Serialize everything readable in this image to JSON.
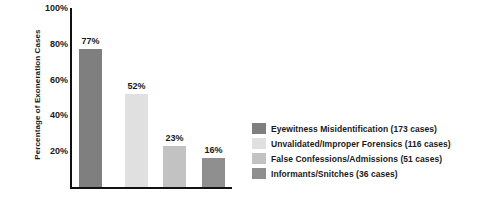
{
  "chart_data": {
    "type": "bar",
    "title": "",
    "xlabel": "",
    "ylabel": "Percentage of Exoneration Cases",
    "ylim": [
      0,
      100
    ],
    "grid": false,
    "legend_position": "right",
    "ytick_labels": [
      "100%",
      "80%",
      "60%",
      "40%",
      "20%"
    ],
    "ytick_values": [
      100,
      80,
      60,
      40,
      20
    ],
    "categories": [
      "Eyewitness Misidentification",
      "Unvalidated/Improper Forensics",
      "False Confessions/Admissions",
      "Informants/Snitches"
    ],
    "values": [
      77,
      52,
      23,
      16
    ],
    "data_labels": [
      "77%",
      "52%",
      "23%",
      "16%"
    ],
    "counts": [
      173,
      116,
      51,
      36
    ],
    "bar_colors": [
      "#7f7f7f",
      "#e0e0e0",
      "#c2c2c2",
      "#8f8f8f"
    ],
    "legend": [
      {
        "label": "Eyewitness Misidentification (173 cases)",
        "color": "#7f7f7f"
      },
      {
        "label": "Unvalidated/Improper Forensics (116 cases)",
        "color": "#e0e0e0"
      },
      {
        "label": "False Confessions/Admissions (51 cases)",
        "color": "#c2c2c2"
      },
      {
        "label": "Informants/Snitches (36 cases)",
        "color": "#8f8f8f"
      }
    ],
    "axis_color": "#111111",
    "background": "#ffffff"
  }
}
